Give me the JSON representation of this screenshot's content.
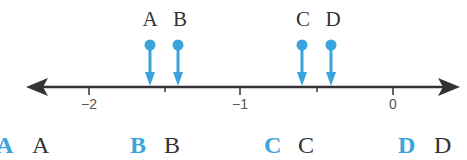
{
  "number_line": {
    "min_tick": -2,
    "max_tick": 0,
    "ticks": [
      {
        "value": -2,
        "label": "−2",
        "x": 89
      },
      {
        "value": -1.5,
        "label": "",
        "x": 165
      },
      {
        "value": -1,
        "label": "−1",
        "x": 240
      },
      {
        "value": -0.5,
        "label": "",
        "x": 317
      },
      {
        "value": 0,
        "label": "0",
        "x": 393
      }
    ],
    "line_y": 87,
    "line_color": "#333333"
  },
  "points": [
    {
      "label": "A",
      "value": -1.6,
      "x": 150
    },
    {
      "label": "B",
      "value": -1.4,
      "x": 178
    },
    {
      "label": "C",
      "value": -0.6,
      "x": 302
    },
    {
      "label": "D",
      "value": -0.4,
      "x": 331
    }
  ],
  "point_color": "#3aa4dc",
  "key": [
    {
      "blue": "A",
      "dark": "A",
      "x_blue": -4,
      "x_dark": 32
    },
    {
      "blue": "B",
      "dark": "B",
      "x_blue": 130,
      "x_dark": 164
    },
    {
      "blue": "C",
      "dark": "C",
      "x_blue": 264,
      "x_dark": 298
    },
    {
      "blue": "D",
      "dark": "D",
      "x_blue": 398,
      "x_dark": 434
    }
  ]
}
